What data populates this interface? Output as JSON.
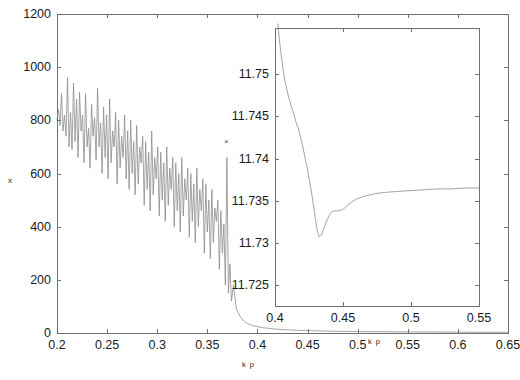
{
  "figure": {
    "background_color": "#ffffff",
    "line_color": "#8d8d8d",
    "axis_color": "#6f6f6f",
    "text_color": "#1a1a1a"
  },
  "main_axes": {
    "xlabel": "k p",
    "ylabel": "x",
    "xticklabels": [
      "0.2",
      "0.25",
      "0.3",
      "0.35",
      "0.4",
      "0.45",
      "0.5",
      "0.55",
      "0.6",
      "0.65"
    ],
    "yticklabels": [
      "0",
      "200",
      "400",
      "600",
      "800",
      "1000",
      "1200"
    ],
    "peak_marker": "×"
  },
  "inset_axes": {
    "xlabel": "k p",
    "xticklabels": [
      "0.4",
      "0.45",
      "0.5",
      "0.55"
    ],
    "yticklabels": [
      "11.725",
      "11.73",
      "11.735",
      "11.74",
      "11.745",
      "11.75"
    ]
  },
  "chart_data": {
    "type": "line",
    "title": "",
    "panels": [
      {
        "name": "main",
        "xlabel": "k p",
        "ylabel": "x",
        "xlim": [
          0.2,
          0.65
        ],
        "ylim": [
          0,
          1200
        ],
        "xticks": [
          0.2,
          0.25,
          0.3,
          0.35,
          0.4,
          0.45,
          0.5,
          0.55,
          0.6,
          0.65
        ],
        "yticks": [
          0,
          200,
          400,
          600,
          800,
          1000,
          1200
        ],
        "grid": false,
        "legend": "none",
        "annotations": [
          {
            "text": "×",
            "x": 0.3695,
            "y": 680,
            "note": "marker at tall spike peak"
          }
        ],
        "description": "Noisy, rapidly oscillating trace that decays from roughly 800-1000 near k p = 0.2 down to near 0 by k p = 0.38, with a single tall isolated spike reaching about 660 at k p = 0.3695; essentially flat near zero for k p > 0.39.",
        "series": [
          {
            "name": "x",
            "x": [
              0.2,
              0.2015,
              0.203,
              0.2045,
              0.206,
              0.2075,
              0.209,
              0.2105,
              0.212,
              0.2135,
              0.215,
              0.2165,
              0.218,
              0.2195,
              0.221,
              0.2225,
              0.224,
              0.2255,
              0.227,
              0.2285,
              0.23,
              0.2315,
              0.233,
              0.2345,
              0.236,
              0.2375,
              0.239,
              0.2405,
              0.242,
              0.2435,
              0.245,
              0.2465,
              0.248,
              0.2495,
              0.251,
              0.2525,
              0.254,
              0.2555,
              0.257,
              0.2585,
              0.26,
              0.2615,
              0.263,
              0.2645,
              0.266,
              0.2675,
              0.269,
              0.2705,
              0.272,
              0.2735,
              0.275,
              0.2765,
              0.278,
              0.2795,
              0.281,
              0.2825,
              0.284,
              0.2855,
              0.287,
              0.2885,
              0.29,
              0.2915,
              0.293,
              0.2945,
              0.296,
              0.2975,
              0.299,
              0.3005,
              0.302,
              0.3035,
              0.305,
              0.3065,
              0.308,
              0.3095,
              0.311,
              0.3125,
              0.314,
              0.3155,
              0.317,
              0.3185,
              0.32,
              0.3215,
              0.323,
              0.3245,
              0.326,
              0.3275,
              0.329,
              0.3305,
              0.332,
              0.3335,
              0.335,
              0.3365,
              0.338,
              0.3395,
              0.341,
              0.3425,
              0.344,
              0.3455,
              0.347,
              0.3485,
              0.35,
              0.3515,
              0.353,
              0.3545,
              0.356,
              0.3575,
              0.359,
              0.3605,
              0.362,
              0.3635,
              0.365,
              0.3665,
              0.368,
              0.3695,
              0.371,
              0.3725,
              0.374,
              0.376,
              0.379,
              0.383,
              0.388,
              0.395,
              0.405,
              0.42,
              0.44,
              0.47,
              0.51,
              0.56,
              0.61,
              0.65
            ],
            "y": [
              800,
              840,
              780,
              900,
              760,
              820,
              740,
              960,
              700,
              830,
              690,
              940,
              720,
              880,
              660,
              905,
              760,
              820,
              640,
              900,
              700,
              770,
              620,
              860,
              740,
              810,
              650,
              920,
              700,
              790,
              600,
              850,
              660,
              820,
              580,
              880,
              640,
              760,
              700,
              830,
              560,
              800,
              620,
              740,
              660,
              820,
              580,
              760,
              540,
              800,
              600,
              720,
              520,
              780,
              560,
              700,
              640,
              740,
              480,
              720,
              540,
              680,
              460,
              760,
              520,
              660,
              580,
              700,
              440,
              680,
              500,
              640,
              420,
              700,
              480,
              620,
              540,
              660,
              400,
              640,
              460,
              600,
              380,
              660,
              440,
              580,
              500,
              620,
              360,
              600,
              420,
              560,
              340,
              620,
              400,
              540,
              460,
              580,
              300,
              560,
              380,
              500,
              280,
              540,
              340,
              470,
              420,
              500,
              240,
              460,
              300,
              410,
              180,
              660,
              150,
              260,
              120,
              180,
              90,
              60,
              40,
              28,
              20,
              14,
              10,
              7,
              5,
              4,
              3,
              3
            ]
          }
        ]
      },
      {
        "name": "inset",
        "xlabel": "k p",
        "ylabel": "",
        "xlim": [
          0.4,
          0.55
        ],
        "ylim": [
          11.7225,
          11.7555
        ],
        "xticks": [
          0.4,
          0.45,
          0.5,
          0.55
        ],
        "yticks": [
          11.725,
          11.73,
          11.735,
          11.74,
          11.745,
          11.75
        ],
        "grid": false,
        "legend": "none",
        "description": "Smooth curve entering at top-left near 11.756 at k p = 0.402, falling steeply with a small shoulder near 11.7435 at k p = 0.415, reaching a minimum of about 11.7307 at k p = 0.4325, rebounding to a small plateau near 11.7338 at k p = 0.447, then rising slowly and saturating near 11.7365 by k p = 0.55.",
        "series": [
          {
            "name": "x_zoom",
            "x": [
              0.402,
              0.404,
              0.406,
              0.408,
              0.41,
              0.412,
              0.414,
              0.4155,
              0.417,
              0.419,
              0.421,
              0.423,
              0.425,
              0.427,
              0.429,
              0.431,
              0.4325,
              0.434,
              0.436,
              0.438,
              0.44,
              0.442,
              0.444,
              0.446,
              0.447,
              0.449,
              0.451,
              0.453,
              0.456,
              0.46,
              0.465,
              0.47,
              0.476,
              0.482,
              0.49,
              0.5,
              0.51,
              0.52,
              0.53,
              0.54,
              0.545,
              0.55
            ],
            "y": [
              11.756,
              11.753,
              11.7505,
              11.7487,
              11.7473,
              11.7462,
              11.7452,
              11.7443,
              11.7437,
              11.7424,
              11.741,
              11.7394,
              11.7377,
              11.7358,
              11.7336,
              11.7315,
              11.7307,
              11.7309,
              11.7317,
              11.7326,
              11.7333,
              11.7337,
              11.7338,
              11.7338,
              11.7338,
              11.7339,
              11.7341,
              11.7344,
              11.7348,
              11.7352,
              11.7355,
              11.7357,
              11.7359,
              11.736,
              11.7361,
              11.7362,
              11.7363,
              11.7364,
              11.7364,
              11.7365,
              11.7365,
              11.7365
            ]
          }
        ]
      }
    ]
  }
}
